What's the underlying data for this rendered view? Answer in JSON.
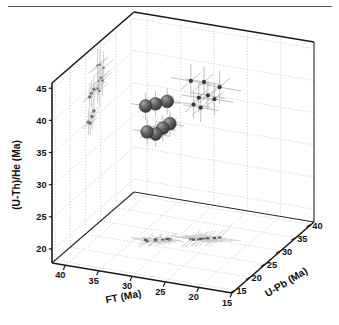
{
  "figure": {
    "kind": "3d-scatter",
    "background": "#ffffff",
    "top_rule_color": "#5a5a5a"
  },
  "chart_data": {
    "type": "scatter",
    "title": "",
    "xlabel": "FT (Ma)",
    "ylabel": "(U-Th)/He (Ma)",
    "zlabel": "U-Pb (Ma)",
    "grid": true,
    "legend": null,
    "projection": "3d",
    "xlim": [
      15,
      42
    ],
    "ylim": [
      18,
      46
    ],
    "zlim": [
      14,
      41
    ],
    "xticks": [
      40,
      35,
      30,
      25,
      20,
      15
    ],
    "yticks": [
      45,
      40,
      35,
      30,
      25,
      20
    ],
    "zticks": [
      15,
      20,
      25,
      30,
      35,
      40
    ],
    "x_axis_direction": "descending",
    "axis_titles": {
      "x": "FT (Ma)",
      "y": "(U-Th)/He (Ma)",
      "z": "U-Pb (Ma)"
    },
    "marker_style": {
      "main": "shaded-sphere",
      "main_color": "#4a4a4a",
      "main_highlight": "#9a9a9a",
      "secondary": "small-circle",
      "secondary_color": "#3a3a3a",
      "projection_color": "#6f6f6f",
      "errorbar_color": "#b3b3b3"
    },
    "points": [
      {
        "x": 33.2,
        "y": 35.0,
        "z": 26.0,
        "style": "sphere",
        "ex": 2.2,
        "ey": 2.0,
        "ez": 2.4
      },
      {
        "x": 32.2,
        "y": 34.6,
        "z": 26.6,
        "style": "sphere",
        "ex": 2.1,
        "ey": 1.9,
        "ez": 2.3
      },
      {
        "x": 31.4,
        "y": 35.4,
        "z": 27.2,
        "style": "sphere",
        "ex": 2.0,
        "ey": 2.0,
        "ez": 2.2
      },
      {
        "x": 30.6,
        "y": 36.0,
        "z": 27.8,
        "style": "sphere",
        "ex": 2.1,
        "ey": 2.0,
        "ez": 2.3
      },
      {
        "x": 33.6,
        "y": 38.8,
        "z": 26.4,
        "style": "sphere",
        "ex": 2.2,
        "ey": 2.1,
        "ez": 2.4
      },
      {
        "x": 32.4,
        "y": 39.1,
        "z": 27.0,
        "style": "sphere",
        "ex": 2.1,
        "ey": 2.0,
        "ez": 2.3
      },
      {
        "x": 31.0,
        "y": 39.4,
        "z": 27.8,
        "style": "sphere",
        "ex": 2.0,
        "ey": 2.0,
        "ez": 2.2
      },
      {
        "x": 28.0,
        "y": 42.6,
        "z": 29.0,
        "style": "dot",
        "ex": 3.0,
        "ey": 2.6,
        "ez": 3.2
      },
      {
        "x": 26.4,
        "y": 42.4,
        "z": 29.8,
        "style": "dot",
        "ex": 2.8,
        "ey": 2.4,
        "ez": 3.0
      },
      {
        "x": 24.6,
        "y": 41.4,
        "z": 31.0,
        "style": "dot",
        "ex": 3.2,
        "ey": 2.6,
        "ez": 3.4
      },
      {
        "x": 26.0,
        "y": 40.2,
        "z": 30.2,
        "style": "dot",
        "ex": 2.6,
        "ey": 2.2,
        "ez": 2.8
      },
      {
        "x": 27.0,
        "y": 40.0,
        "z": 29.4,
        "style": "dot",
        "ex": 2.6,
        "ey": 2.2,
        "ez": 2.8
      },
      {
        "x": 25.2,
        "y": 39.6,
        "z": 30.6,
        "style": "dot",
        "ex": 2.8,
        "ey": 2.4,
        "ez": 3.0
      },
      {
        "x": 27.6,
        "y": 39.0,
        "z": 29.0,
        "style": "dot",
        "ex": 2.6,
        "ey": 2.2,
        "ez": 2.8
      },
      {
        "x": 26.8,
        "y": 38.4,
        "z": 29.6,
        "style": "dot",
        "ex": 2.6,
        "ey": 2.2,
        "ez": 2.8
      }
    ]
  },
  "axes": {
    "y_title": "(U-Th)/He (Ma)",
    "x_title": "FT (Ma)",
    "z_title": "U-Pb (Ma)",
    "y_tick_labels": [
      "45",
      "40",
      "35",
      "30",
      "25",
      "20"
    ],
    "x_tick_labels": [
      "40",
      "35",
      "30",
      "25",
      "20",
      "15"
    ],
    "z_tick_labels": [
      "15",
      "20",
      "25",
      "30",
      "35",
      "40"
    ]
  }
}
